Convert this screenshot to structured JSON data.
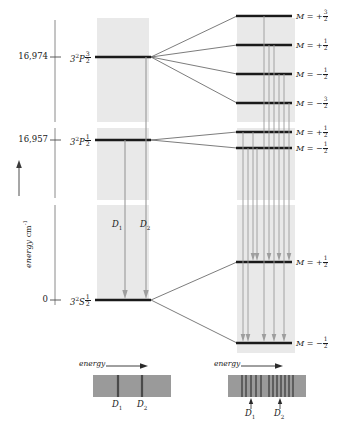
{
  "figure": {
    "type": "energy-level-diagram",
    "axis": {
      "label": "energy",
      "units": "cm",
      "units_exponent": "-1",
      "arrow": "up-arrow",
      "ticks": [
        {
          "value": "16,974",
          "y": 57
        },
        {
          "value": "16,957",
          "y": 140
        },
        {
          "value": "0",
          "y": 300
        }
      ]
    },
    "colors": {
      "panel_fill": "#e8e8e8",
      "level_line": "#1a1a1a",
      "transition_line": "#808080",
      "spectrum_bg": "#9a9a9a",
      "spectrum_line": "#4a4a4a",
      "connector": "#5a5a5a"
    },
    "unsplit_levels": [
      {
        "name": "3P32",
        "term_base": "3",
        "term_sup": "2",
        "term_letter": "P",
        "term_sub_n": "3",
        "term_sub_d": "2",
        "y": 57
      },
      {
        "name": "3P12",
        "term_base": "3",
        "term_sup": "2",
        "term_letter": "P",
        "term_sub_n": "1",
        "term_sub_d": "2",
        "y": 140
      },
      {
        "name": "3S12",
        "term_base": "3",
        "term_sup": "2",
        "term_letter": "S",
        "term_sub_n": "1",
        "term_sub_d": "2",
        "y": 300
      }
    ],
    "transitions_unsplit": [
      {
        "name": "D1",
        "label_base": "D",
        "label_sub": "1",
        "x": 125,
        "label_x": 112,
        "label_y": 226
      },
      {
        "name": "D2",
        "label_base": "D",
        "label_sub": "2",
        "x": 146,
        "label_x": 140,
        "label_y": 226
      }
    ],
    "split_levels": [
      {
        "group": "3P32",
        "m_sign": "+",
        "m_num": "3",
        "m_den": "2",
        "y": 16
      },
      {
        "group": "3P32",
        "m_sign": "+",
        "m_num": "1",
        "m_den": "2",
        "y": 45
      },
      {
        "group": "3P32",
        "m_sign": "−",
        "m_num": "1",
        "m_den": "2",
        "y": 74
      },
      {
        "group": "3P32",
        "m_sign": "−",
        "m_num": "3",
        "m_den": "2",
        "y": 103
      },
      {
        "group": "3P12",
        "m_sign": "+",
        "m_num": "1",
        "m_den": "2",
        "y": 132
      },
      {
        "group": "3P12",
        "m_sign": "−",
        "m_num": "1",
        "m_den": "2",
        "y": 148
      },
      {
        "group": "3S12",
        "m_sign": "+",
        "m_num": "1",
        "m_den": "2",
        "y": 262
      },
      {
        "group": "3S12",
        "m_sign": "−",
        "m_num": "1",
        "m_den": "2",
        "y": 343
      }
    ],
    "m_prefix": "M",
    "m_equals": "=",
    "spectra": [
      {
        "name": "spectrum-unsplit",
        "caption": "energy",
        "caption_arrow": "right-arrow",
        "x": 93,
        "y": 375,
        "w": 78,
        "h": 22,
        "lines": [
          0.32,
          0.63
        ],
        "labels": [
          {
            "base": "D",
            "sub": "1",
            "x": 0.32
          },
          {
            "base": "D",
            "sub": "2",
            "x": 0.63
          }
        ],
        "has_pointer_arrows": false
      },
      {
        "name": "spectrum-split",
        "caption": "energy",
        "caption_arrow": "right-arrow",
        "x": 228,
        "y": 375,
        "w": 78,
        "h": 22,
        "lines": [
          0.18,
          0.24,
          0.3,
          0.36,
          0.42,
          0.52,
          0.58,
          0.63,
          0.68,
          0.73,
          0.78,
          0.83
        ],
        "labels": [
          {
            "base": "D",
            "sub": "1",
            "x": 0.3
          },
          {
            "base": "D",
            "sub": "2",
            "x": 0.66
          }
        ],
        "has_pointer_arrows": true
      }
    ],
    "panels": [
      {
        "name": "panel-unsplit",
        "x": 97,
        "w": 52
      },
      {
        "name": "panel-split",
        "x": 237,
        "w": 58
      }
    ]
  }
}
